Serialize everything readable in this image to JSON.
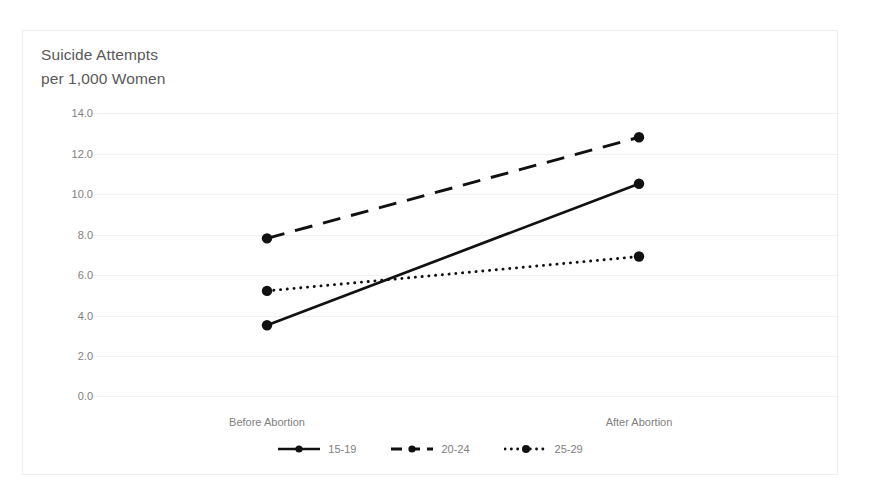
{
  "chart_data": {
    "type": "line",
    "title_line1": "Suicide Attempts",
    "title_line2": "per 1,000 Women",
    "xlabel": "",
    "ylabel": "",
    "categories": [
      "Before Abortion",
      "After Abortion"
    ],
    "ylim": [
      0.0,
      14.0
    ],
    "ytick_step": 2.0,
    "ytick_labels": [
      "14.0",
      "12.0",
      "10.0",
      "8.0",
      "6.0",
      "4.0",
      "2.0",
      "0.0"
    ],
    "ytick_values": [
      14.0,
      12.0,
      10.0,
      8.0,
      6.0,
      4.0,
      2.0,
      0.0
    ],
    "grid": true,
    "grid_axis": "y",
    "legend_position": "bottom",
    "series": [
      {
        "name": "15-19",
        "values": [
          3.5,
          10.5
        ],
        "style": "solid",
        "color": "#111111"
      },
      {
        "name": "20-24",
        "values": [
          7.8,
          12.8
        ],
        "style": "dashed",
        "color": "#111111"
      },
      {
        "name": "25-29",
        "values": [
          5.2,
          6.9
        ],
        "style": "dotted",
        "color": "#111111"
      }
    ]
  },
  "legend": {
    "entries": [
      {
        "label": "15-19",
        "marker": "solid-line-with-dot-icon"
      },
      {
        "label": "20-24",
        "marker": "dashed-line-with-dot-icon"
      },
      {
        "label": "25-29",
        "marker": "dotted-line-with-dot-icon"
      }
    ]
  },
  "axes": {
    "x_labels": [
      "Before Abortion",
      "After Abortion"
    ],
    "y_labels": [
      "14.0",
      "12.0",
      "10.0",
      "8.0",
      "6.0",
      "4.0",
      "2.0",
      "0.0"
    ]
  },
  "colors": {
    "ink": "#111111",
    "text": "#808080",
    "title": "#595959",
    "grid": "#f2f2f2",
    "frame": "#eeeeee",
    "background": "#ffffff"
  }
}
